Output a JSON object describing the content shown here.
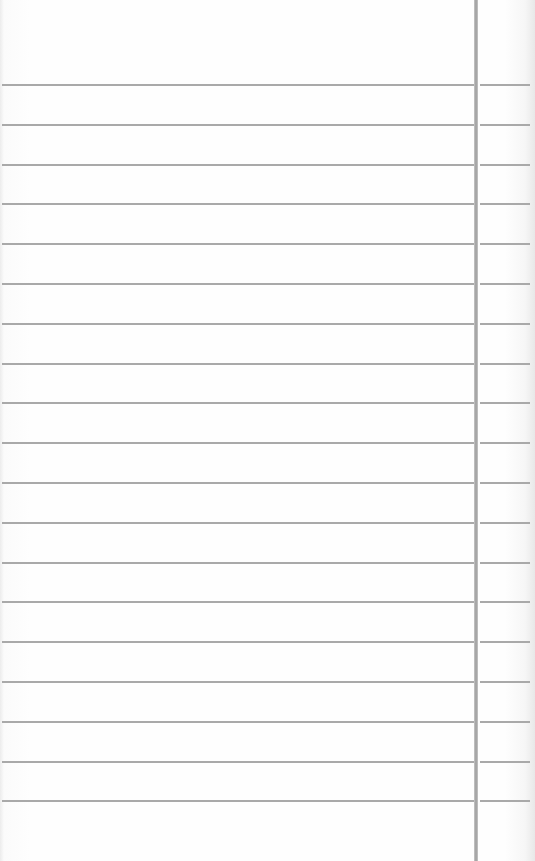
{
  "paper": {
    "type": "ruled-notepad",
    "line_color": "#a9a9a9",
    "margin_line_color": "#9c9c9c",
    "background_color": "#fdfdfd",
    "first_line_y": 84,
    "line_spacing": 39.8,
    "line_count": 19,
    "margin_x": 474
  }
}
